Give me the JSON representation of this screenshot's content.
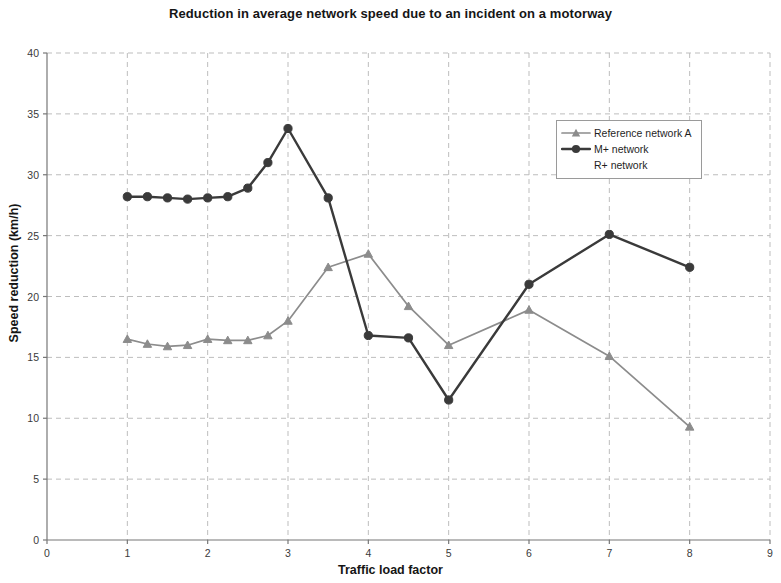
{
  "chart_data": {
    "type": "line",
    "title": "Reduction in average network speed due to an incident on a motorway",
    "xlabel": "Traffic load factor",
    "ylabel": "Speed reduction (km/h)",
    "xlim": [
      0,
      9
    ],
    "ylim": [
      0,
      40
    ],
    "xticks": [
      0,
      1,
      2,
      3,
      4,
      5,
      6,
      7,
      8,
      9
    ],
    "yticks": [
      0,
      5,
      10,
      15,
      20,
      25,
      30,
      35,
      40
    ],
    "grid": true,
    "grid_style": "dashed",
    "legend_position": "upper right inside plot",
    "series": [
      {
        "name": "Reference network A",
        "color": "#8c8c8c",
        "marker": "triangle",
        "x": [
          1,
          1.25,
          1.5,
          1.75,
          2,
          2.25,
          2.5,
          2.75,
          3,
          3.5,
          4,
          4.5,
          5,
          6,
          7,
          8
        ],
        "values": [
          16.5,
          16.1,
          15.9,
          16.0,
          16.5,
          16.4,
          16.4,
          16.8,
          18.0,
          22.4,
          23.5,
          19.2,
          16.0,
          18.9,
          15.1,
          9.3
        ]
      },
      {
        "name": "M+ network",
        "color": "#3a3a3a",
        "marker": "circle",
        "x": [
          1,
          1.25,
          1.5,
          1.75,
          2,
          2.25,
          2.5,
          2.75,
          3,
          3.5,
          4,
          4.5,
          5,
          6,
          7,
          8
        ],
        "values": [
          28.2,
          28.2,
          28.1,
          28.0,
          28.1,
          28.2,
          28.9,
          31.0,
          33.8,
          28.1,
          16.8,
          16.6,
          11.5,
          21.0,
          25.1,
          22.4
        ]
      },
      {
        "name": "R+ network",
        "color": "#3a3a3a",
        "marker": "none",
        "x": [],
        "values": []
      }
    ]
  },
  "legend": {
    "items": [
      {
        "label": "Reference network A",
        "marker": "triangle",
        "color": "#8c8c8c",
        "show_line": true
      },
      {
        "label": "M+ network",
        "marker": "circle",
        "color": "#3a3a3a",
        "show_line": true
      },
      {
        "label": "R+ network",
        "marker": "none",
        "color": "#3a3a3a",
        "show_line": false
      }
    ]
  },
  "axes": {
    "x_tick_labels": [
      "0",
      "1",
      "2",
      "3",
      "4",
      "5",
      "6",
      "7",
      "8",
      "9"
    ],
    "y_tick_labels": [
      "0",
      "5",
      "10",
      "15",
      "20",
      "25",
      "30",
      "35",
      "40"
    ]
  }
}
